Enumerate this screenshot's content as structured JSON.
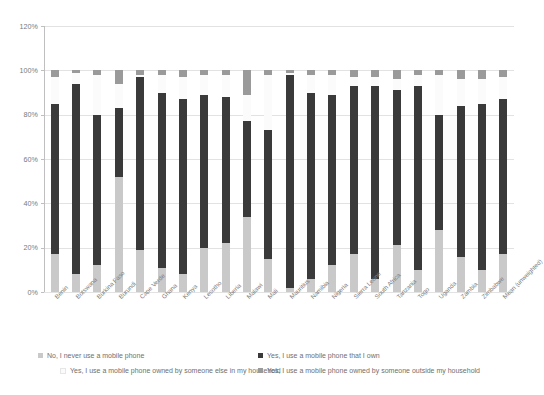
{
  "chart_data": {
    "type": "bar",
    "subtype": "stacked-bar",
    "title": "",
    "subtitle": "",
    "xlabel": "",
    "ylabel": "",
    "ylim": [
      0,
      120
    ],
    "ytick_values": [
      0,
      20,
      40,
      60,
      80,
      100,
      120
    ],
    "ytick_labels": [
      "0%",
      "20%",
      "40%",
      "60%",
      "80%",
      "100%",
      "120%"
    ],
    "grid": true,
    "legend_position": "bottom",
    "categories": [
      "Benin",
      "Botswana",
      "Burkina Faso",
      "Burundi",
      "Cape Verde",
      "Ghana",
      "Kenya",
      "Lesotho",
      "Liberia",
      "Malawi",
      "Mali",
      "Mauritius",
      "Namibia",
      "Nigeria",
      "Sierra Leone",
      "South Africa",
      "Tanzania",
      "Togo",
      "Uganda",
      "Zambia",
      "Zimbabwe",
      "Mean (unweighted)"
    ],
    "series": [
      {
        "name": "No, I never use a mobile phone",
        "color": "#c9c9c9",
        "values": [
          17,
          8,
          12,
          52,
          19,
          11,
          8,
          20,
          22,
          34,
          15,
          2,
          6,
          12,
          17,
          6,
          21,
          10,
          28,
          16,
          10,
          17
        ]
      },
      {
        "name": "Yes, I use a mobile phone that I own",
        "color": "#3a3a3a",
        "values": [
          68,
          86,
          68,
          31,
          78,
          79,
          79,
          69,
          66,
          43,
          58,
          96,
          84,
          77,
          76,
          87,
          70,
          83,
          52,
          68,
          75,
          70
        ]
      },
      {
        "name": "Yes, I use a mobile phone owned by someone else in my household",
        "color": "#fbfbfb",
        "values": [
          12,
          5,
          18,
          11,
          1,
          8,
          10,
          9,
          10,
          12,
          25,
          1,
          8,
          9,
          4,
          4,
          5,
          5,
          18,
          12,
          11,
          10
        ]
      },
      {
        "name": "Yes, I use a mobile phone owned by someone outside my household",
        "color": "#9a9a9a",
        "values": [
          3,
          1,
          2,
          6,
          2,
          2,
          3,
          2,
          2,
          11,
          2,
          1,
          2,
          2,
          3,
          3,
          4,
          2,
          2,
          4,
          4,
          3
        ]
      }
    ],
    "totals": [
      100,
      100,
      100,
      100,
      100,
      100,
      100,
      100,
      100,
      100,
      100,
      100,
      100,
      100,
      100,
      100,
      100,
      100,
      100,
      100,
      100,
      100
    ]
  },
  "legend": {
    "entries": [
      "No, I never use a mobile phone",
      "Yes, I use a mobile phone that I own",
      "Yes, I use a mobile phone owned by someone else in my household",
      "Yes, I use a mobile phone owned by someone outside my household"
    ]
  }
}
